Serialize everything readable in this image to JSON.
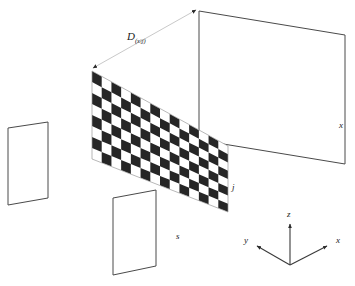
{
  "figure": {
    "background_color": "#ffffff",
    "width": 355,
    "height": 286
  },
  "labels": {
    "distance": {
      "base": "D",
      "subscript": "(x|j)",
      "full": "D(x|j)",
      "x": 127,
      "y": 40
    },
    "right_panel": {
      "text": "x",
      "x": 339,
      "y": 128
    },
    "board": {
      "text": "j",
      "x": 232,
      "y": 190
    },
    "bottom_panel": {
      "text": "s",
      "x": 176,
      "y": 239
    }
  },
  "axes": {
    "origin": {
      "x": 290,
      "y": 265
    },
    "items": [
      {
        "name": "z-axis",
        "label": "z",
        "label_x": 287,
        "label_y": 217,
        "tip_x": 290,
        "tip_y": 222
      },
      {
        "name": "y-axis",
        "label": "y",
        "label_x": 245,
        "label_y": 243,
        "tip_x": 255,
        "tip_y": 245
      },
      {
        "name": "x-axis",
        "label": "x",
        "label_x": 337,
        "label_y": 243,
        "tip_x": 329,
        "tip_y": 245
      }
    ]
  },
  "shapes": {
    "left_panel": {
      "name": "left-plane",
      "points": "8,128 48,122 48,198 8,205",
      "stroke": "#4a4a4a",
      "fill": "#ffffff"
    },
    "bottom_panel": {
      "name": "bottom-plane",
      "points": "113,198 156,190 156,266 113,275",
      "stroke": "#4a4a4a",
      "fill": "#ffffff"
    },
    "right_panel": {
      "name": "right-plane",
      "points": "199,11 345,35 345,164 199,140",
      "stroke": "#4a4a4a",
      "fill": "#ffffff"
    },
    "checkerboard": {
      "name": "checkerboard-plane",
      "top_left": {
        "x": 92,
        "y": 71
      },
      "top_right": {
        "x": 228,
        "y": 146
      },
      "bottom_right": {
        "x": 228,
        "y": 212
      },
      "bottom_left": {
        "x": 92,
        "y": 159
      },
      "columns": 14,
      "rows": 8,
      "dark_color": "#262626",
      "light_color": "#ffffff"
    },
    "measure_line": {
      "name": "distance-measure-line",
      "from": {
        "x": 93,
        "y": 68
      },
      "to": {
        "x": 196,
        "y": 10
      },
      "stroke": "#c9c9c9"
    }
  },
  "colors": {
    "ink": "#1a1a1a",
    "edge": "#4a4a4a",
    "guide": "#c9c9c9",
    "board_dark": "#262626",
    "board_light": "#ffffff",
    "background": "#ffffff"
  }
}
